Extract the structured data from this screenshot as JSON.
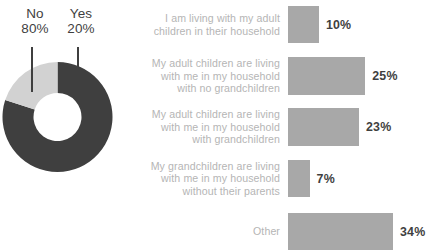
{
  "chart_data": [
    {
      "type": "pie",
      "title": "",
      "variant": "donut",
      "legend_position": "top-callout",
      "labels": [
        "No",
        "Yes"
      ],
      "values": [
        80,
        20
      ],
      "value_suffix": "%",
      "colors": [
        "#3f3f3f",
        "#d2d2d2"
      ],
      "slices": [
        {
          "label": "No",
          "value": 80,
          "value_label": "80%",
          "color": "#3f3f3f"
        },
        {
          "label": "Yes",
          "value": 20,
          "value_label": "20%",
          "color": "#d2d2d2"
        }
      ]
    },
    {
      "type": "bar",
      "orientation": "horizontal",
      "title": "",
      "xlabel": "",
      "ylabel": "",
      "xlim": [
        0,
        34
      ],
      "grid": false,
      "bar_color": "#a8a8a8",
      "categories": [
        "I am living with my adult children in their household",
        "My adult children are living with me in my household with no grandchildren",
        "My adult children are living with me in my household with grandchildren",
        "My grandchildren are living with me in my household without their parents",
        "Other"
      ],
      "values": [
        10,
        25,
        23,
        7,
        34
      ],
      "value_labels": [
        "10%",
        "25%",
        "23%",
        "7%",
        "34%"
      ]
    }
  ],
  "donut": {
    "callouts": [
      {
        "name": "No",
        "value": "80%"
      },
      {
        "name": "Yes",
        "value": "20%"
      }
    ]
  },
  "bars": {
    "rows": [
      {
        "label_lines": [
          "I am living with my adult",
          "children in their household"
        ],
        "label": "I am living with my adult children in their household",
        "value": 10,
        "value_label": "10%"
      },
      {
        "label_lines": [
          "My adult children are living",
          "with me in my household",
          "with no grandchildren"
        ],
        "label": "My adult children are living with me in my household with no grandchildren",
        "value": 25,
        "value_label": "25%"
      },
      {
        "label_lines": [
          "My adult children are living",
          "with me in my household",
          "with grandchildren"
        ],
        "label": "My adult children are living with me in my household with grandchildren",
        "value": 23,
        "value_label": "23%"
      },
      {
        "label_lines": [
          "My grandchildren are living",
          "with me in my household",
          "without their parents"
        ],
        "label": "My grandchildren are living with me in my household without their parents",
        "value": 7,
        "value_label": "7%"
      },
      {
        "label_lines": [
          "Other"
        ],
        "label": "Other",
        "value": 34,
        "value_label": "34%"
      }
    ]
  },
  "colors": {
    "dark_gray": "#3f3f3f",
    "light_gray": "#d2d2d2",
    "bar_gray": "#a8a8a8",
    "label_gray": "#b5b5b5",
    "background": "#ffffff"
  }
}
